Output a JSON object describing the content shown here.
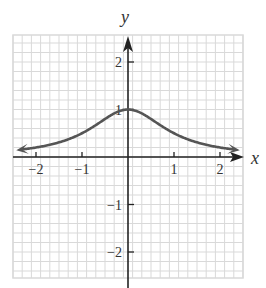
{
  "chart_data": {
    "type": "line",
    "title": "",
    "xlabel": "x",
    "ylabel": "y",
    "xlim": [
      -2.5,
      2.5
    ],
    "ylim": [
      -2.6,
      2.6
    ],
    "grid": true,
    "grid_minor_per_unit": 5,
    "x_ticks": [
      -2,
      -1,
      1,
      2
    ],
    "x_tick_labels": [
      "−2",
      "−1",
      "1",
      "2"
    ],
    "y_ticks": [
      2,
      1,
      -1,
      -2
    ],
    "y_tick_labels": [
      "2",
      "1",
      "−1",
      "−2"
    ],
    "series": [
      {
        "name": "y = 1/(1+x^2)",
        "curve_color": "#555555",
        "arrows_both_ends": true,
        "x": [
          -2.3,
          -2,
          -1.5,
          -1,
          -0.5,
          0,
          0.5,
          1,
          1.5,
          2,
          2.3
        ],
        "y": [
          0.16,
          0.2,
          0.31,
          0.5,
          0.8,
          1,
          0.8,
          0.5,
          0.31,
          0.2,
          0.16
        ]
      }
    ],
    "annotations": []
  },
  "colors": {
    "grid": "#d9d9d9",
    "axis": "#222222",
    "curve": "#555555"
  }
}
